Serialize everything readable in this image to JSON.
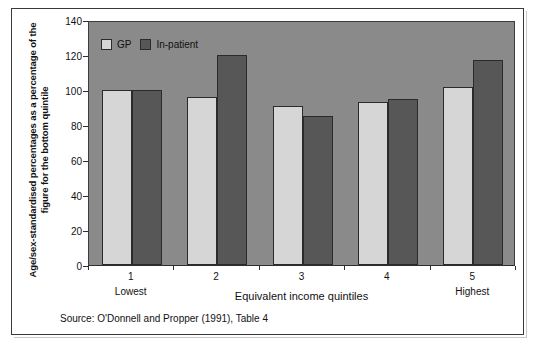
{
  "figure": {
    "source_note": "Source: O'Donnell and Propper (1991), Table 4"
  },
  "chart_data": {
    "type": "bar",
    "title": "",
    "subtitle": "",
    "xlabel": "Equivalent income quintiles",
    "ylabel": "Age/sex-standardised percentages as a percentage of the figure for the bottom quintile",
    "categories": [
      "1",
      "2",
      "3",
      "4",
      "5"
    ],
    "category_sublabels": [
      "Lowest",
      "",
      "",
      "",
      "Highest"
    ],
    "series": [
      {
        "name": "GP",
        "color": "#d6d6d6",
        "values": [
          100,
          96,
          91,
          93,
          102
        ]
      },
      {
        "name": "In-patient",
        "color": "#575757",
        "values": [
          100,
          120,
          85,
          95,
          117
        ]
      }
    ],
    "legend": [
      "GP",
      "In-patient"
    ],
    "legend_position": "inside-top-left",
    "ylim": [
      0,
      140
    ],
    "yticks": [
      0,
      20,
      40,
      60,
      80,
      100,
      120,
      140
    ],
    "ytick_labels": [
      "0",
      "20",
      "40",
      "60",
      "80",
      "100",
      "120",
      "140"
    ],
    "grid": false,
    "plot_background": "#8a8a8a",
    "axis_color": "#2e2e2e"
  }
}
